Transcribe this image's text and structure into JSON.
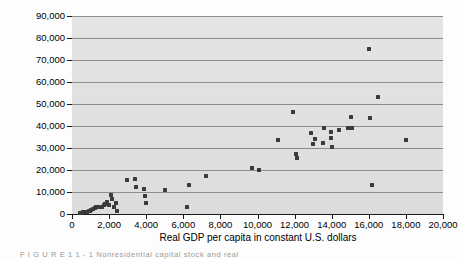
{
  "figure": {
    "caption_fragment": "F I G U R E   1 1 - 1   Nonresidential capital stock and real",
    "plot_background_color": "#e2e2e2",
    "gridline_color": "#8d8d8d",
    "marker_color": "#3a3a3a",
    "axis_color": "#1a1a1a"
  },
  "chart_data": {
    "type": "scatter",
    "title": "",
    "xlabel": "Real GDP per capita in constant U.S. dollars",
    "ylabel": "Nonresidential capital stock per capita ($)",
    "xlim": [
      0,
      20000
    ],
    "ylim": [
      0,
      90000
    ],
    "xticks": [
      0,
      2000,
      4000,
      6000,
      8000,
      10000,
      12000,
      14000,
      16000,
      18000,
      20000
    ],
    "xtick_labels": [
      "0",
      "2,000",
      "4,000",
      "6,000",
      "8,000",
      "10,000",
      "12,000",
      "14,000",
      "16,000",
      "18,000",
      "20,000"
    ],
    "yticks": [
      0,
      10000,
      20000,
      30000,
      40000,
      50000,
      60000,
      70000,
      80000,
      90000
    ],
    "ytick_labels": [
      "0",
      "10,000",
      "20,000",
      "30,000",
      "40,000",
      "50,000",
      "60,000",
      "70,000",
      "80,000",
      "90,000"
    ],
    "grid": "horizontal",
    "legend": "none",
    "marker": "square",
    "points": [
      [
        430,
        400
      ],
      [
        520,
        500
      ],
      [
        600,
        700
      ],
      [
        700,
        900
      ],
      [
        760,
        1100
      ],
      [
        830,
        900
      ],
      [
        900,
        1300
      ],
      [
        980,
        1200
      ],
      [
        1050,
        1900
      ],
      [
        1150,
        2100
      ],
      [
        1250,
        2600
      ],
      [
        1320,
        3000
      ],
      [
        1420,
        3100
      ],
      [
        1500,
        3400
      ],
      [
        1620,
        3300
      ],
      [
        1700,
        4000
      ],
      [
        1800,
        4400
      ],
      [
        1900,
        5300
      ],
      [
        1980,
        4300
      ],
      [
        2100,
        8600
      ],
      [
        2150,
        6700
      ],
      [
        2250,
        3100
      ],
      [
        2350,
        4800
      ],
      [
        2400,
        1500
      ],
      [
        2950,
        15400
      ],
      [
        3400,
        15800
      ],
      [
        3450,
        12200
      ],
      [
        3900,
        11300
      ],
      [
        3950,
        8100
      ],
      [
        3980,
        5100
      ],
      [
        5000,
        10700
      ],
      [
        6200,
        3100
      ],
      [
        6300,
        13100
      ],
      [
        7200,
        17400
      ],
      [
        9700,
        21000
      ],
      [
        10100,
        20200
      ],
      [
        11100,
        33700
      ],
      [
        11900,
        46200
      ],
      [
        12100,
        27200
      ],
      [
        12150,
        25400
      ],
      [
        12900,
        36600
      ],
      [
        13000,
        31800
      ],
      [
        13100,
        34300
      ],
      [
        13550,
        32100
      ],
      [
        13600,
        39200
      ],
      [
        13950,
        37100
      ],
      [
        13980,
        34700
      ],
      [
        14000,
        30500
      ],
      [
        14400,
        38100
      ],
      [
        14900,
        39100
      ],
      [
        15050,
        44200
      ],
      [
        15100,
        38900
      ],
      [
        16000,
        75200
      ],
      [
        16050,
        43700
      ],
      [
        16150,
        13000
      ],
      [
        16500,
        53000
      ],
      [
        18000,
        33600
      ]
    ]
  }
}
